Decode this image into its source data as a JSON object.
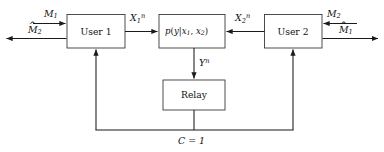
{
  "diagram": {
    "blocks": [
      {
        "id": "user1",
        "label": "User 1"
      },
      {
        "id": "channel",
        "label": "p(y|x1, x2)"
      },
      {
        "id": "user2",
        "label": "User 2"
      },
      {
        "id": "relay",
        "label": "Relay"
      }
    ],
    "labels": {
      "m1": "M",
      "m1_sub": "1",
      "m2hat": "M",
      "m2hat_sub": "2",
      "m2": "M",
      "m2_sub": "2",
      "m1hat": "M",
      "m1hat_sub": "1",
      "hat_mark": "^",
      "x1": "X",
      "x1_sub": "1",
      "x1_sup": "n",
      "x2": "X",
      "x2_sub": "2",
      "x2_sup": "n",
      "yn": "Y",
      "yn_sup": "n",
      "conference": "C = 1"
    },
    "channel_text": {
      "p": "p",
      "open": "(",
      "y": "y",
      "bar": "|",
      "x": "x",
      "sub1": "1",
      "comma": ", ",
      "x2": "x",
      "sub2": "2",
      "close": ")"
    },
    "colors": {
      "line": "#1a1a1a",
      "box_stroke": "#3a3a3a",
      "background": "#ffffff",
      "text": "#111111"
    }
  }
}
